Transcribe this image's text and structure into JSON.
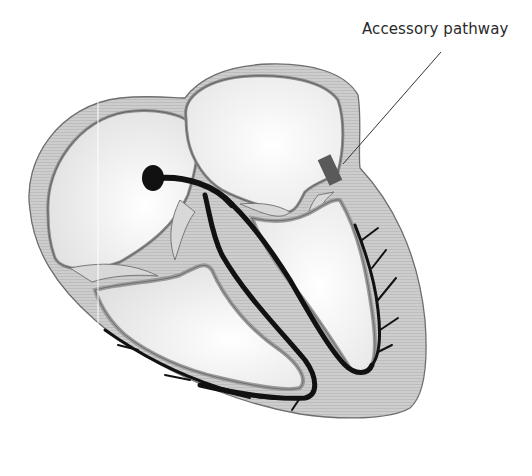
{
  "diagram": {
    "labels": [
      {
        "id": "accessory-pathway",
        "text": "Accessory pathway"
      }
    ],
    "colors": {
      "background": "#ffffff",
      "wall_fill": "#c9c9c9",
      "wall_stroke": "#6e6e6e",
      "endocardium": "#a8a8a8",
      "chamber_fill": "#f2f2f2",
      "conduction": "#111111",
      "accessory_pathway": "#5a5a5a",
      "leader_line": "#333333",
      "label_text": "#2a2a2a"
    },
    "structures": [
      "right-atrium",
      "left-atrium",
      "right-ventricle",
      "left-ventricle",
      "sinoatrial-node",
      "atrioventricular-pathway",
      "bundle-branches",
      "purkinje-fibers",
      "accessory-pathway"
    ]
  }
}
